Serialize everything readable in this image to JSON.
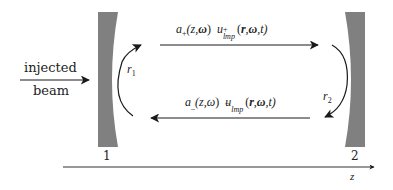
{
  "diagram": {
    "type": "optical-cavity",
    "colors": {
      "mirror_fill": "#808080",
      "line": "#1a1a1a",
      "text": "#222222",
      "background": "#ffffff"
    },
    "input": {
      "label_line1": "injected",
      "label_line2": "beam"
    },
    "mirrors": [
      {
        "id": "mirror-1",
        "label": "1",
        "reflectivity_label": "r",
        "reflectivity_sub": "1"
      },
      {
        "id": "mirror-2",
        "label": "2",
        "reflectivity_label": "r",
        "reflectivity_sub": "2"
      }
    ],
    "forward_wave": {
      "direction": "right",
      "amp": "a",
      "amp_sub": "+",
      "amp_args": "(z,",
      "amp_omega": "ω",
      "amp_close": ")",
      "mode": "u",
      "mode_sup": "+",
      "mode_sub": "lmp",
      "mode_args_open": "(",
      "mode_r": "r",
      "mode_sep1": ",",
      "mode_omega": "ω",
      "mode_rest": ",t)"
    },
    "backward_wave": {
      "direction": "left",
      "amp": "a",
      "amp_sub": "_",
      "amp_args": "(z,",
      "amp_omega": "ω",
      "amp_close": ")",
      "mode": "u",
      "mode_sup": "–",
      "mode_sub": "lmp",
      "mode_args_open": "(",
      "mode_r": "r",
      "mode_sep1": ",",
      "mode_omega": "ω",
      "mode_rest": ",t)"
    },
    "axis": {
      "label": "z"
    }
  }
}
